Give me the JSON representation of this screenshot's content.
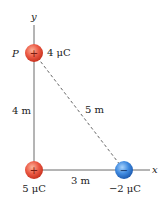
{
  "diagram": {
    "axes": {
      "x_label": "x",
      "y_label": "y",
      "color": "#666666"
    },
    "points": {
      "P_label": "P"
    },
    "charges": [
      {
        "id": "q1",
        "position": "P (0, 4 m)",
        "value_label": "4 μC",
        "sign": "+",
        "color": "#e8473a"
      },
      {
        "id": "q2",
        "position": "origin (0, 0)",
        "value_label": "5 μC",
        "sign": "+",
        "color": "#e8473a"
      },
      {
        "id": "q3",
        "position": "(3 m, 0)",
        "value_label": "−2 μC",
        "sign": "−",
        "color": "#3b7fd9"
      }
    ],
    "distances": {
      "vertical": "4 m",
      "horizontal": "3 m",
      "diagonal": "5 m"
    }
  }
}
